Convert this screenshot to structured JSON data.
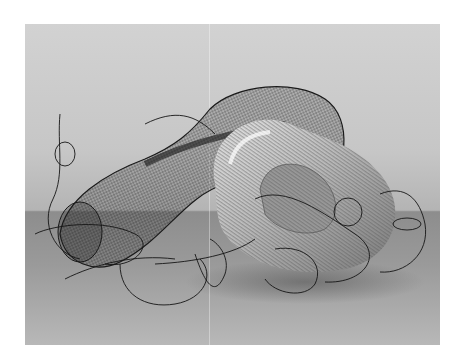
{
  "image": {
    "subject": "sculpture",
    "description": "Black-and-white photograph of a sculpture: a black wire-mesh tube with loose looping wires intertwined with a silver ribbed flexible-duct torus, on a gray floor against a light gray wall",
    "colors": {
      "page_background": "#ffffff",
      "wall": "#c8c8c8",
      "floor": "#8d8d8d",
      "wire": "#1a1a1a",
      "duct_highlight": "#f0f0f0",
      "duct_shadow": "#6e6e6e"
    }
  }
}
